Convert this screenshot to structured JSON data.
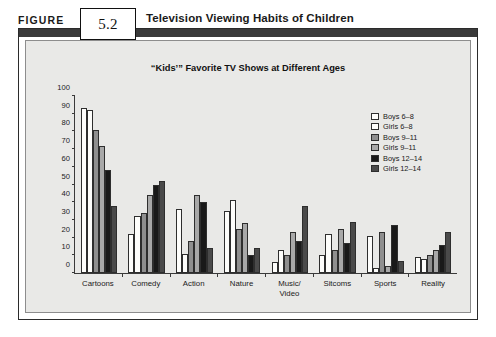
{
  "header": {
    "figure_word": "FIGURE",
    "figure_number": "5.2",
    "figure_title": "Television Viewing Habits of Children"
  },
  "source": {
    "text": "Source: www.quirks.com"
  },
  "chart_data": {
    "type": "bar",
    "title": "“Kids’” Favorite TV Shows at Different Ages",
    "xlabel": "",
    "ylabel": "",
    "ylim": [
      0,
      100
    ],
    "yticks": [
      0,
      10,
      20,
      30,
      40,
      50,
      60,
      70,
      80,
      90,
      100
    ],
    "ytick_labels": [
      "0",
      "10",
      "20",
      "30",
      "40",
      "50",
      "60",
      "70",
      "80",
      "90",
      "100"
    ],
    "grid": false,
    "legend_position": "upper-right",
    "categories": [
      "Cartoons",
      "Comedy",
      "Action",
      "Nature",
      "Music/\nVideo",
      "Sitcoms",
      "Sports",
      "Reality"
    ],
    "series": [
      {
        "name": "Boys 6–8",
        "color": "#fdfdfb",
        "values": [
          93,
          22,
          36,
          35,
          6,
          10,
          21,
          9
        ]
      },
      {
        "name": "Girls 6–8",
        "color": "#fdfdfb",
        "values": [
          92,
          32,
          11,
          41,
          13,
          22,
          3,
          8
        ]
      },
      {
        "name": "Boys 9–11",
        "color": "#8f8f8f",
        "values": [
          81,
          34,
          18,
          25,
          10,
          13,
          23,
          10
        ]
      },
      {
        "name": "Girls 9–11",
        "color": "#a8a8a8",
        "values": [
          72,
          44,
          44,
          28,
          23,
          25,
          4,
          13
        ]
      },
      {
        "name": "Boys 12–14",
        "color": "#191919",
        "values": [
          58,
          50,
          40,
          10,
          18,
          17,
          27,
          16
        ]
      },
      {
        "name": "Girls 12–14",
        "color": "#4a4a4a",
        "values": [
          38,
          52,
          14,
          14,
          38,
          29,
          7,
          23
        ]
      }
    ]
  }
}
